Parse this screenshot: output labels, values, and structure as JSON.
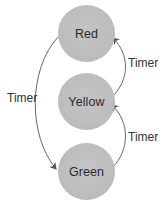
{
  "diagram": {
    "type": "state-machine",
    "states": [
      {
        "id": "red",
        "label": "Red"
      },
      {
        "id": "yellow",
        "label": "Yellow"
      },
      {
        "id": "green",
        "label": "Green"
      }
    ],
    "transitions": [
      {
        "from": "red",
        "to": "green",
        "label": "Timer"
      },
      {
        "from": "yellow",
        "to": "red",
        "label": "Timer"
      },
      {
        "from": "green",
        "to": "yellow",
        "label": "Timer"
      }
    ],
    "colors": {
      "node_fill": "#bdbdbd",
      "edge_stroke": "#555555",
      "text": "#2a2a2a"
    }
  }
}
